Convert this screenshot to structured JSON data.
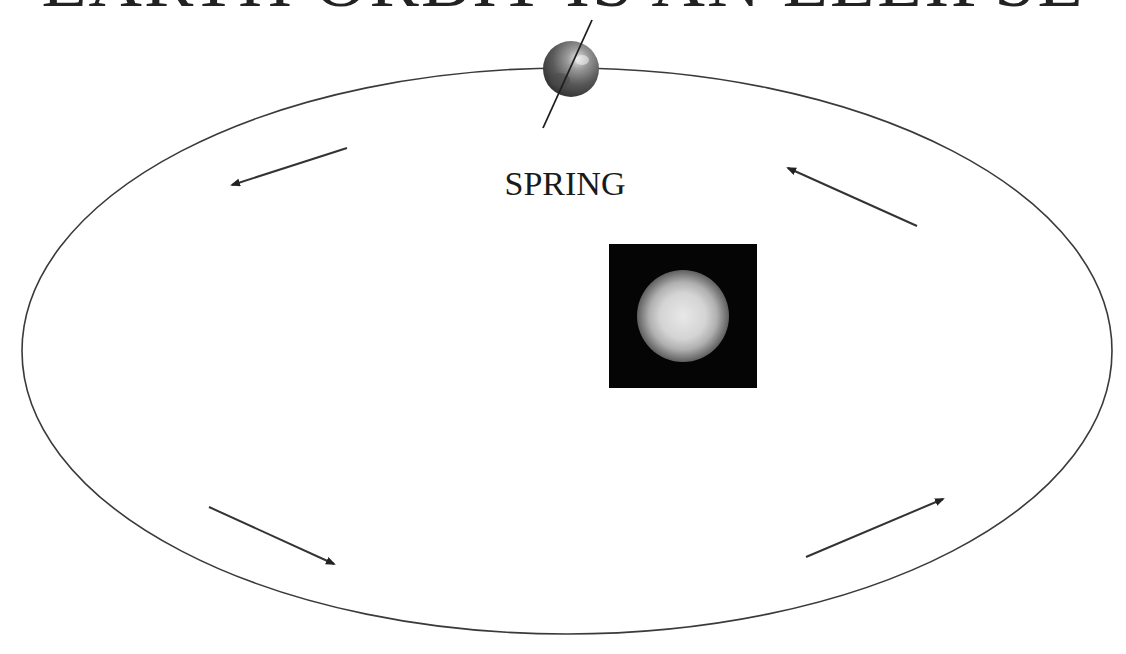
{
  "title": "EARTH ORBIT IS AN ELLIPSE",
  "season_label": "SPRING",
  "diagram": {
    "orbit": {
      "shape": "ellipse",
      "cx": 567,
      "cy": 351,
      "rx": 545,
      "ry": 283,
      "stroke": "#3a3a3a"
    },
    "earth": {
      "cx": 571,
      "cy": 69,
      "r": 28,
      "axis": {
        "x1": 592,
        "y1": 20,
        "x2": 543,
        "y2": 128
      }
    },
    "sun": {
      "box": {
        "x": 609,
        "y": 244,
        "w": 148,
        "h": 144
      },
      "box_color": "#050505"
    },
    "arrows": [
      {
        "name": "arrow-top-left",
        "x1": 347,
        "y1": 148,
        "x2": 232,
        "y2": 185,
        "direction": "counter-clockwise"
      },
      {
        "name": "arrow-top-right",
        "x1": 917,
        "y1": 226,
        "x2": 788,
        "y2": 168,
        "direction": "counter-clockwise"
      },
      {
        "name": "arrow-bottom-left",
        "x1": 209,
        "y1": 507,
        "x2": 334,
        "y2": 564,
        "direction": "counter-clockwise"
      },
      {
        "name": "arrow-bottom-right",
        "x1": 806,
        "y1": 557,
        "x2": 943,
        "y2": 499,
        "direction": "counter-clockwise"
      }
    ]
  }
}
